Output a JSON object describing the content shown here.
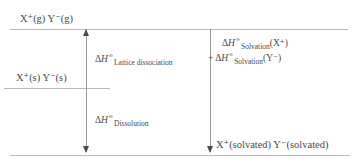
{
  "diagram": {
    "levels": {
      "gas": "X⁺(g)  Y⁻(g)",
      "solid": "X⁺(s)  Y⁻(s)",
      "solvated": "X⁺(solvated)  Y⁻(solvated)"
    },
    "terms": {
      "lattice": {
        "symbol": "ΔH",
        "standard_state": "⦵",
        "subscript": "Lattice dissociation",
        "full": "ΔH⦵ Lattice dissociation"
      },
      "dissolution": {
        "symbol": "ΔH",
        "standard_state": "⦵",
        "subscript": "Dissolution",
        "full": "ΔH⦵ Dissolution"
      },
      "solvation_cation": {
        "symbol": "ΔH",
        "standard_state": "⦵",
        "subscript": "Solvation",
        "species": "(X⁺)",
        "full": "ΔH⦵ Solvation(X⁺)"
      },
      "solvation_anion": {
        "plus": "+",
        "symbol": "ΔH",
        "standard_state": "⦵",
        "subscript": "Solvation",
        "species": "(Y⁻)",
        "full": "+ ΔH⦵ Solvation(Y⁻)"
      }
    },
    "colors": {
      "level_line": "#b8b8b8",
      "arrow": "#9a9a9a",
      "arrow_head": "#4a4a4a",
      "text": "#4a4a4a",
      "background": "#ffffff"
    }
  }
}
